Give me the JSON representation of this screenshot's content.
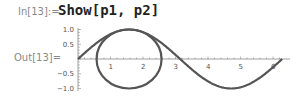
{
  "cell": {
    "in_label": "In[13]:=",
    "out_label": "Out[13]=",
    "input": "Show[p1, p2]"
  },
  "chart_data": {
    "type": "line",
    "title": "",
    "xlabel": "",
    "ylabel": "",
    "xlim": [
      0,
      6.2832
    ],
    "ylim": [
      -1.0,
      1.0
    ],
    "x_ticks": [
      "1",
      "2",
      "3",
      "4",
      "5",
      "6"
    ],
    "y_ticks": [
      "1.0",
      "0.5",
      "-0.5",
      "-1.0"
    ],
    "series": [
      {
        "name": "p1",
        "kind": "sin(x)",
        "x": [
          0,
          0.785,
          1.571,
          2.356,
          3.142,
          3.927,
          4.712,
          5.498,
          6.283
        ],
        "y": [
          0,
          0.707,
          1,
          0.707,
          0,
          -0.707,
          -1,
          -0.707,
          0
        ]
      },
      {
        "name": "p2",
        "kind": "circle",
        "center": [
          1.571,
          0
        ],
        "radius": 1
      }
    ],
    "grid": false,
    "legend": "none",
    "colors": {
      "curve": "#555555",
      "axis": "#888888"
    }
  }
}
